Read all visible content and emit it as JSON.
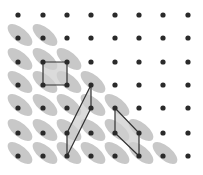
{
  "diagram": {
    "type": "dot-lattice-with-shapes",
    "background": "#ffffff",
    "dot_color": "#2a2a2a",
    "dot_radius": 2.6,
    "ellipse_color": "#c8c8c8",
    "shape_fill": "#cfcfcf",
    "shape_stroke": "#333333",
    "columns_x": [
      18,
      43,
      67,
      91,
      115,
      139,
      163,
      188
    ],
    "rows_y": [
      15,
      38,
      62,
      85,
      108,
      133,
      156
    ],
    "ellipse_dots": [
      [
        1,
        0
      ],
      [
        1,
        1
      ],
      [
        2,
        0
      ],
      [
        2,
        1
      ],
      [
        2,
        2
      ],
      [
        3,
        0
      ],
      [
        3,
        1
      ],
      [
        3,
        2
      ],
      [
        3,
        3
      ],
      [
        4,
        0
      ],
      [
        4,
        1
      ],
      [
        4,
        2
      ],
      [
        4,
        3
      ],
      [
        4,
        4
      ],
      [
        5,
        0
      ],
      [
        5,
        1
      ],
      [
        5,
        2
      ],
      [
        5,
        3
      ],
      [
        5,
        4
      ],
      [
        5,
        5
      ],
      [
        6,
        0
      ],
      [
        6,
        1
      ],
      [
        6,
        2
      ],
      [
        6,
        3
      ],
      [
        6,
        4
      ],
      [
        6,
        5
      ],
      [
        6,
        6
      ]
    ],
    "shapes": [
      {
        "name": "square",
        "points": [
          [
            43,
            62
          ],
          [
            67,
            62
          ],
          [
            67,
            85
          ],
          [
            43,
            85
          ]
        ]
      },
      {
        "name": "tall-parallelogram",
        "points": [
          [
            91,
            85
          ],
          [
            91,
            108
          ],
          [
            67,
            156
          ],
          [
            67,
            133
          ]
        ]
      },
      {
        "name": "slanted-parallelogram",
        "points": [
          [
            115,
            108
          ],
          [
            139,
            133
          ],
          [
            139,
            156
          ],
          [
            115,
            133
          ]
        ]
      }
    ]
  }
}
